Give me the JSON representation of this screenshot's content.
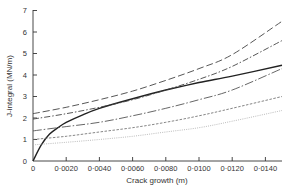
{
  "chart_data": {
    "type": "line",
    "title": "",
    "xlabel": "Crack growth (m)",
    "ylabel": "J-integral (MN/m)",
    "xlim": [
      0,
      0.015
    ],
    "ylim": [
      0,
      7
    ],
    "xticks": [
      0,
      0.002,
      0.004,
      0.006,
      0.008,
      0.01,
      0.012,
      0.014
    ],
    "xtick_labels": [
      "0",
      "0·0020",
      "0·0040",
      "0·0060",
      "0·0080",
      "0·0100",
      "0·0120",
      "0·0140"
    ],
    "yticks": [
      0,
      1,
      2,
      3,
      4,
      5,
      6,
      7
    ],
    "ytick_labels": [
      "0",
      "1",
      "2",
      "3",
      "4",
      "5",
      "6",
      "7"
    ],
    "grid": false,
    "legend": null,
    "series": [
      {
        "name": "J-R curve (solid)",
        "style": "solid",
        "color": "#222222",
        "width": 1.4,
        "x": [
          0,
          0.0005,
          0.001,
          0.0015,
          0.002,
          0.003,
          0.004,
          0.006,
          0.008,
          0.01,
          0.012,
          0.015
        ],
        "y": [
          0,
          0.75,
          1.25,
          1.55,
          1.8,
          2.15,
          2.45,
          2.9,
          3.3,
          3.65,
          3.95,
          4.45
        ]
      },
      {
        "name": "Applied J (long dash)",
        "style": "dash",
        "color": "#444444",
        "width": 0.9,
        "x": [
          0,
          0.002,
          0.004,
          0.006,
          0.008,
          0.01,
          0.012,
          0.015
        ],
        "y": [
          2.2,
          2.5,
          2.85,
          3.25,
          3.75,
          4.3,
          4.95,
          6.5
        ]
      },
      {
        "name": "Applied J (dash-dot)",
        "style": "dashdot",
        "color": "#444444",
        "width": 0.9,
        "x": [
          0,
          0.002,
          0.004,
          0.006,
          0.008,
          0.01,
          0.012,
          0.015
        ],
        "y": [
          1.95,
          2.2,
          2.5,
          2.85,
          3.3,
          3.8,
          4.4,
          5.6
        ]
      },
      {
        "name": "Applied J (long-dash-dot)",
        "style": "longdashdot",
        "color": "#555555",
        "width": 0.9,
        "x": [
          0,
          0.002,
          0.004,
          0.006,
          0.008,
          0.01,
          0.012,
          0.015
        ],
        "y": [
          1.4,
          1.6,
          1.8,
          2.1,
          2.45,
          2.85,
          3.3,
          4.3
        ]
      },
      {
        "name": "Applied J (short dash)",
        "style": "shortdash",
        "color": "#666666",
        "width": 0.8,
        "x": [
          0,
          0.002,
          0.004,
          0.006,
          0.008,
          0.01,
          0.012,
          0.015
        ],
        "y": [
          1.0,
          1.15,
          1.35,
          1.55,
          1.8,
          2.1,
          2.45,
          3.0
        ]
      },
      {
        "name": "Applied J (dotted)",
        "style": "dotted",
        "color": "#aaaaaa",
        "width": 0.8,
        "x": [
          0,
          0.002,
          0.004,
          0.006,
          0.008,
          0.01,
          0.012,
          0.015
        ],
        "y": [
          0.75,
          0.87,
          1.0,
          1.15,
          1.35,
          1.55,
          1.85,
          2.35
        ]
      }
    ]
  }
}
